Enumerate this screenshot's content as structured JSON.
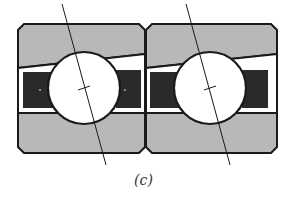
{
  "figure": {
    "caption": "(c)",
    "colors": {
      "ring_fill": "#b8b8b8",
      "cage_fill": "#2a2a2a",
      "outline": "#1a1a1a",
      "ball_fill": "#ffffff",
      "background": "#ffffff"
    },
    "bearings": [
      {
        "id": "left",
        "x": 18,
        "ball_cx": 84,
        "ball_cy": 88,
        "ball_r": 36,
        "contact_line": [
          62,
          4,
          106,
          165
        ]
      },
      {
        "id": "right",
        "x": 146,
        "ball_cx": 210,
        "ball_cy": 88,
        "ball_r": 36,
        "contact_line": [
          186,
          4,
          230,
          165
        ]
      }
    ]
  }
}
